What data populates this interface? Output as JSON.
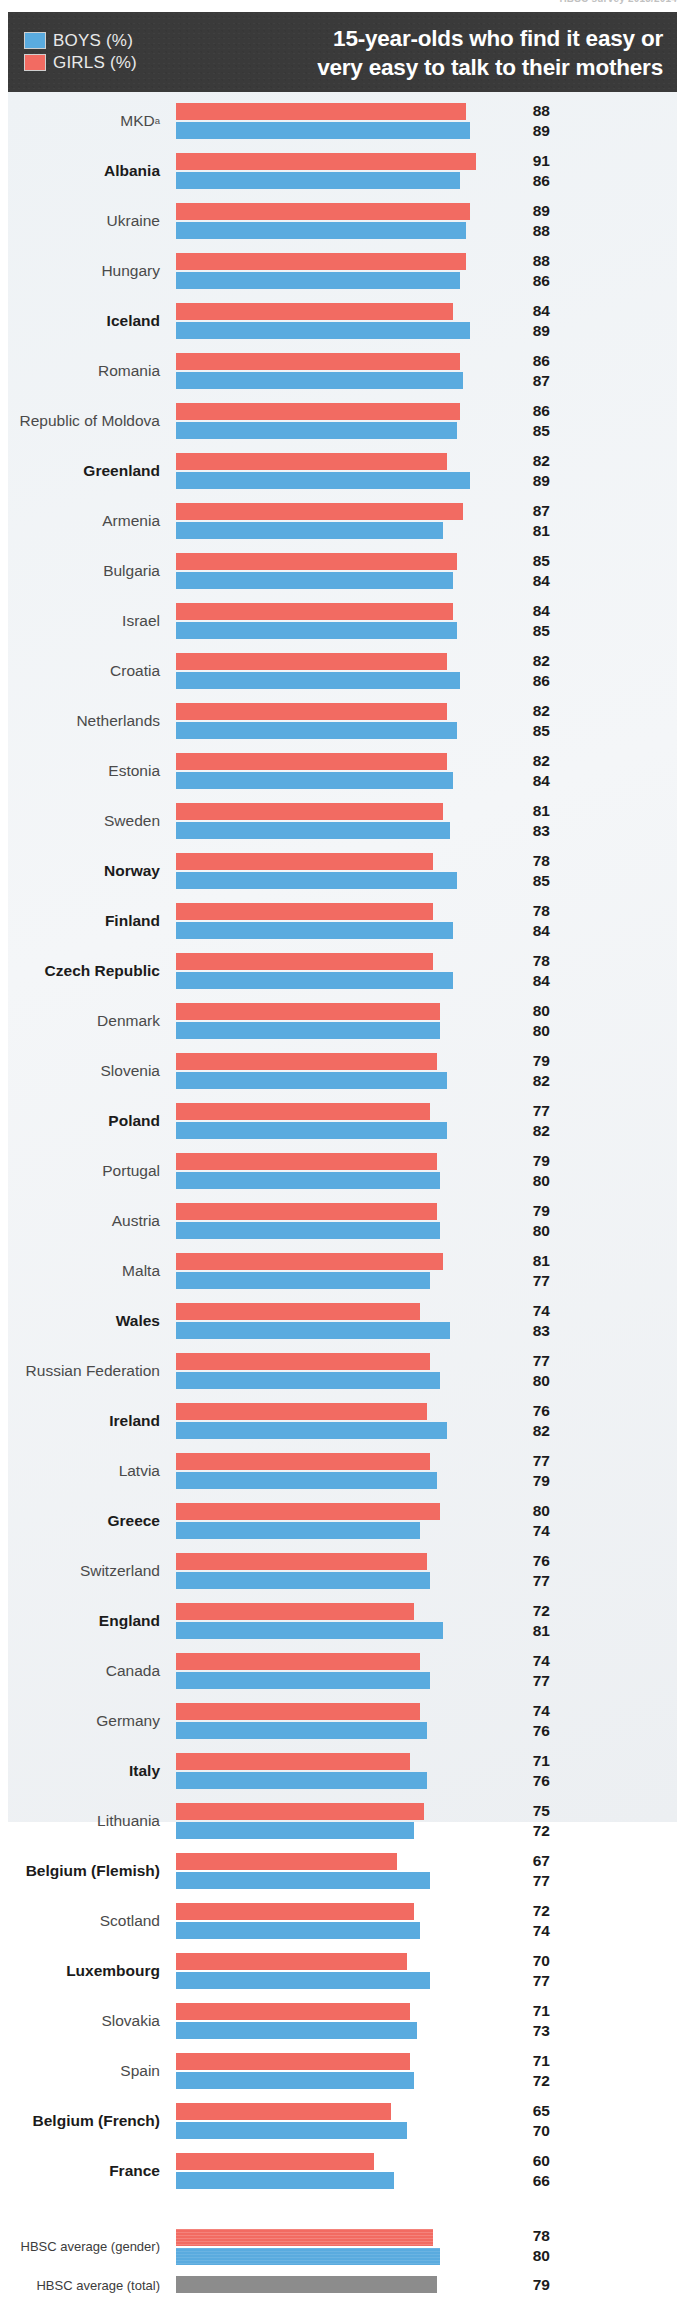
{
  "source_note": "HBSC survey 2013/2014",
  "header": {
    "title_line1": "15-year-olds who find it easy or",
    "title_line2": "very easy to talk to their mothers",
    "legend": [
      {
        "key": "boys",
        "label": "BOYS (%)",
        "color": "#5aabdf"
      },
      {
        "key": "girls",
        "label": "GIRLS (%)",
        "color": "#f26b62"
      }
    ]
  },
  "averages": {
    "gender_label": "HBSC average (gender)",
    "total_label": "HBSC average (total)",
    "girls": 78,
    "boys": 80,
    "total": 79,
    "total_color": "#8c8c8c"
  },
  "chart_data": {
    "type": "bar",
    "title": "15-year-olds who find it easy or very easy to talk to their mothers",
    "subtitle": "",
    "xlabel": "%",
    "ylabel": "",
    "xlim": [
      0,
      100
    ],
    "grid": false,
    "legend_position": "top-left",
    "orientation": "horizontal",
    "categories": [
      "MKDᵃ",
      "Albania",
      "Ukraine",
      "Hungary",
      "Iceland",
      "Romania",
      "Republic of Moldova",
      "Greenland",
      "Armenia",
      "Bulgaria",
      "Israel",
      "Croatia",
      "Netherlands",
      "Estonia",
      "Sweden",
      "Norway",
      "Finland",
      "Czech Republic",
      "Denmark",
      "Slovenia",
      "Poland",
      "Portugal",
      "Austria",
      "Malta",
      "Wales",
      "Russian Federation",
      "Ireland",
      "Latvia",
      "Greece",
      "Switzerland",
      "England",
      "Canada",
      "Germany",
      "Italy",
      "Lithuania",
      "Belgium (Flemish)",
      "Scotland",
      "Luxembourg",
      "Slovakia",
      "Spain",
      "Belgium (French)",
      "France"
    ],
    "series": [
      {
        "name": "GIRLS (%)",
        "color": "#f26b62",
        "values": [
          88,
          91,
          89,
          88,
          84,
          86,
          86,
          82,
          87,
          85,
          84,
          82,
          82,
          82,
          81,
          78,
          78,
          78,
          80,
          79,
          77,
          79,
          79,
          81,
          74,
          77,
          76,
          77,
          80,
          76,
          72,
          74,
          74,
          71,
          75,
          67,
          72,
          70,
          71,
          71,
          65,
          60
        ]
      },
      {
        "name": "BOYS (%)",
        "color": "#5aabdf",
        "values": [
          89,
          86,
          88,
          86,
          89,
          87,
          85,
          89,
          81,
          84,
          85,
          86,
          85,
          84,
          83,
          85,
          84,
          84,
          80,
          82,
          82,
          80,
          80,
          77,
          83,
          80,
          82,
          79,
          74,
          77,
          81,
          77,
          76,
          76,
          72,
          77,
          74,
          77,
          73,
          72,
          70,
          66
        ]
      }
    ],
    "bold_categories": [
      "Albania",
      "Iceland",
      "Greenland",
      "Norway",
      "Finland",
      "Czech Republic",
      "Poland",
      "Wales",
      "Ireland",
      "Greece",
      "England",
      "Italy",
      "Belgium (Flemish)",
      "Luxembourg",
      "Belgium (French)",
      "France"
    ],
    "annotations": [
      {
        "text": "a",
        "target": "MKD",
        "type": "footnote-marker"
      }
    ],
    "averages": {
      "girls": 78,
      "boys": 80,
      "total": 79
    }
  }
}
